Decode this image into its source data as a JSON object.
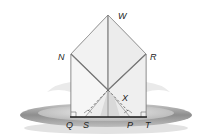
{
  "figure": {
    "labels": {
      "W": "W",
      "N": "N",
      "R": "R",
      "X": "X",
      "Q": "Q",
      "S": "S",
      "P": "P",
      "T": "T"
    },
    "colors": {
      "napkin_fill": "#f4f4f4",
      "napkin_edge": "#777777",
      "plate_outer": "#9a9a9a",
      "plate_inner": "#d8d8d8",
      "label": "#222222"
    }
  }
}
